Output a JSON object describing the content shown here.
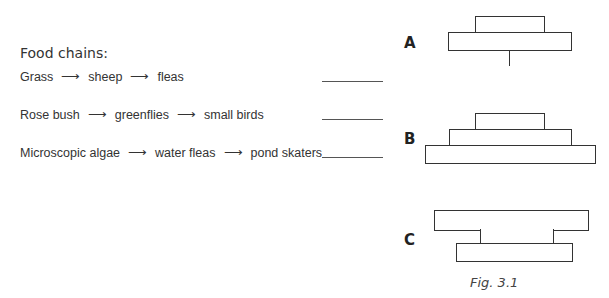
{
  "title": "Food chains:",
  "chains": [
    {
      "items": [
        "Grass",
        "sheep",
        "fleas"
      ]
    },
    {
      "items": [
        "Rose bush",
        "greenflies",
        "small birds"
      ]
    },
    {
      "items": [
        "Microscopic algae",
        "water fleas",
        "pond skaters"
      ]
    }
  ],
  "arrow": "⟶",
  "pyramids": [
    {
      "label": "A"
    },
    {
      "label": "B"
    },
    {
      "label": "C"
    }
  ],
  "figure_caption": "Fig. 3.1"
}
